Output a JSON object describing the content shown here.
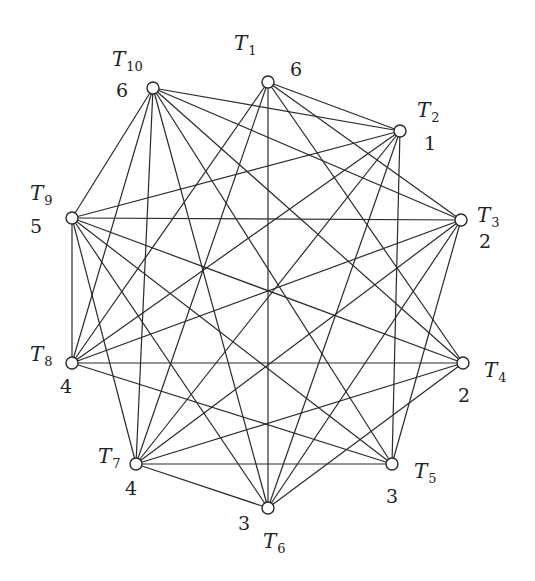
{
  "diagram": {
    "type": "graph",
    "nodes": [
      {
        "id": "T1",
        "name": "T",
        "sub": "1",
        "value": "6",
        "x": 268,
        "y": 82,
        "lx": 234,
        "ly": 50,
        "vx": 290,
        "vy": 76
      },
      {
        "id": "T2",
        "name": "T",
        "sub": "2",
        "value": "1",
        "x": 400,
        "y": 131,
        "lx": 417,
        "ly": 117,
        "vx": 424,
        "vy": 150
      },
      {
        "id": "T3",
        "name": "T",
        "sub": "3",
        "value": "2",
        "x": 461,
        "y": 220,
        "lx": 477,
        "ly": 222,
        "vx": 479,
        "vy": 248
      },
      {
        "id": "T4",
        "name": "T",
        "sub": "4",
        "value": "2",
        "x": 463,
        "y": 363,
        "lx": 484,
        "ly": 377,
        "vx": 458,
        "vy": 402
      },
      {
        "id": "T5",
        "name": "T",
        "sub": "5",
        "value": "3",
        "x": 392,
        "y": 464,
        "lx": 414,
        "ly": 478,
        "vx": 386,
        "vy": 503
      },
      {
        "id": "T6",
        "name": "T",
        "sub": "6",
        "value": "3",
        "x": 268,
        "y": 508,
        "lx": 263,
        "ly": 548,
        "vx": 238,
        "vy": 530
      },
      {
        "id": "T7",
        "name": "T",
        "sub": "7",
        "value": "4",
        "x": 136,
        "y": 464,
        "lx": 98,
        "ly": 463,
        "vx": 125,
        "vy": 495
      },
      {
        "id": "T8",
        "name": "T",
        "sub": "8",
        "value": "4",
        "x": 72,
        "y": 363,
        "lx": 30,
        "ly": 361,
        "vx": 60,
        "vy": 393
      },
      {
        "id": "T9",
        "name": "T",
        "sub": "9",
        "value": "5",
        "x": 72,
        "y": 218,
        "lx": 30,
        "ly": 200,
        "vx": 30,
        "vy": 233
      },
      {
        "id": "T10",
        "name": "T",
        "sub": "10",
        "value": "6",
        "x": 153,
        "y": 88,
        "lx": 112,
        "ly": 66,
        "vx": 116,
        "vy": 97
      }
    ],
    "edges": [
      [
        "T1",
        "T2"
      ],
      [
        "T1",
        "T3"
      ],
      [
        "T1",
        "T4"
      ],
      [
        "T1",
        "T6"
      ],
      [
        "T1",
        "T7"
      ],
      [
        "T1",
        "T8"
      ],
      [
        "T10",
        "T2"
      ],
      [
        "T10",
        "T3"
      ],
      [
        "T10",
        "T4"
      ],
      [
        "T10",
        "T5"
      ],
      [
        "T10",
        "T6"
      ],
      [
        "T10",
        "T7"
      ],
      [
        "T10",
        "T8"
      ],
      [
        "T10",
        "T9"
      ],
      [
        "T2",
        "T9"
      ],
      [
        "T2",
        "T8"
      ],
      [
        "T2",
        "T7"
      ],
      [
        "T2",
        "T6"
      ],
      [
        "T2",
        "T5"
      ],
      [
        "T3",
        "T9"
      ],
      [
        "T3",
        "T8"
      ],
      [
        "T3",
        "T7"
      ],
      [
        "T3",
        "T5"
      ],
      [
        "T9",
        "T8"
      ],
      [
        "T9",
        "T4"
      ],
      [
        "T9",
        "T5"
      ],
      [
        "T9",
        "T6"
      ],
      [
        "T8",
        "T4"
      ],
      [
        "T8",
        "T5"
      ],
      [
        "T7",
        "T6"
      ],
      [
        "T7",
        "T4"
      ],
      [
        "T7",
        "T5"
      ],
      [
        "T7",
        "T9"
      ],
      [
        "T6",
        "T4"
      ],
      [
        "T6",
        "T3"
      ]
    ],
    "colors": {
      "stroke": "#2a2a2a",
      "background": "#ffffff",
      "node_fill": "#ffffff"
    }
  }
}
